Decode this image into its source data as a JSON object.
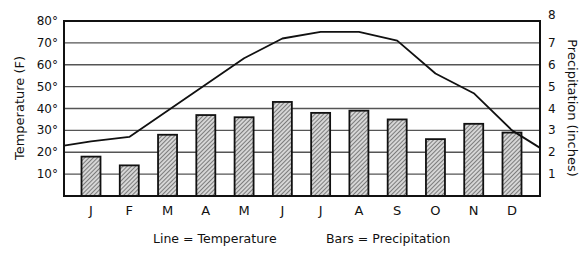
{
  "chart_data": {
    "type": "bar",
    "combo": "bar+line",
    "title": "",
    "categories": [
      "J",
      "F",
      "M",
      "A",
      "M",
      "J",
      "J",
      "A",
      "S",
      "O",
      "N",
      "D"
    ],
    "series": [
      {
        "name": "Precipitation",
        "kind": "bar",
        "axis": "right",
        "unit": "inches",
        "values": [
          1.8,
          1.4,
          2.8,
          3.7,
          3.6,
          4.3,
          3.8,
          3.9,
          3.5,
          2.6,
          3.3,
          2.9
        ]
      },
      {
        "name": "Temperature",
        "kind": "line",
        "axis": "left",
        "unit": "F",
        "values": [
          25,
          27,
          39,
          51,
          63,
          72,
          75,
          75,
          71,
          56,
          47,
          30
        ],
        "start_value": 23,
        "end_value": 22
      }
    ],
    "ylabel_left": "Temperature (F)",
    "ylabel_right": "Precipitation (inches)",
    "ylim_left": [
      0,
      80
    ],
    "ylim_right": [
      0,
      8
    ],
    "yticks_left": [
      "10°",
      "20°",
      "30°",
      "40°",
      "50°",
      "60°",
      "70°",
      "80°"
    ],
    "yticks_right": [
      "1",
      "2",
      "3",
      "4",
      "5",
      "6",
      "7",
      "8"
    ],
    "grid": true,
    "legend": {
      "line_label": "Line = Temperature",
      "bars_label": "Bars = Precipitation",
      "position": "bottom"
    }
  },
  "colors": {
    "bar_fill": "#a8a8a8",
    "bar_stroke": "#111111",
    "line": "#111111",
    "grid": "#555555",
    "axis": "#111111"
  }
}
